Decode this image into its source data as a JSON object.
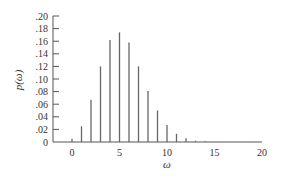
{
  "chart_data": {
    "type": "bar",
    "title": "",
    "xlabel": "ω",
    "ylabel": "p(ω)",
    "x": [
      0,
      1,
      2,
      3,
      4,
      5,
      6,
      7,
      8,
      9,
      10,
      11,
      12,
      13,
      14
    ],
    "values": [
      0.005,
      0.025,
      0.067,
      0.12,
      0.162,
      0.174,
      0.158,
      0.12,
      0.081,
      0.05,
      0.027,
      0.013,
      0.006,
      0.002,
      0.001
    ],
    "xlim": [
      -1.5,
      20
    ],
    "ylim": [
      0,
      0.2
    ],
    "xticks": [
      "0",
      "5",
      "10",
      "15",
      "20"
    ],
    "yticks": [
      ".20",
      ".18",
      ".16",
      ".14",
      ".12",
      ".10",
      ".08",
      ".06",
      ".04",
      ".02",
      "0"
    ],
    "grid": false,
    "legend": null,
    "bar_style": "thin vertical lines (stem)"
  }
}
